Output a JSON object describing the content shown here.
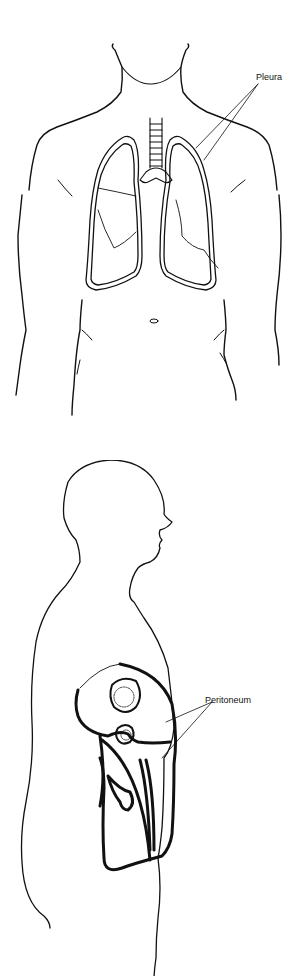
{
  "figures": [
    {
      "id": "front-view",
      "description": "Front view of human torso with lungs, trachea and pleura",
      "labels": [
        {
          "text": "Pleura",
          "x": 256,
          "y": 72
        }
      ]
    },
    {
      "id": "side-view",
      "description": "Side (sagittal) view of human body showing abdominal cavity with peritoneum",
      "labels": [
        {
          "text": "Peritoneum",
          "x": 205,
          "y": 695
        }
      ]
    }
  ],
  "colors": {
    "line": "#111111",
    "background": "#ffffff"
  }
}
